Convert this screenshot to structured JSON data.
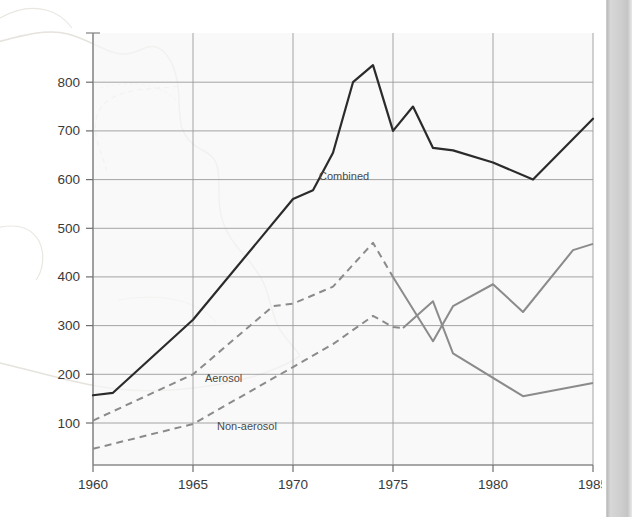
{
  "chart_data": {
    "type": "line",
    "title": "",
    "xlabel": "",
    "ylabel": "",
    "xlim": [
      1960,
      1985
    ],
    "ylim": [
      0,
      860
    ],
    "grid": true,
    "legend_position": "inline-annotations",
    "x_ticks": [
      "1960",
      "1965",
      "1970",
      "1975",
      "1980",
      "1985"
    ],
    "x_tick_values": [
      1960,
      1965,
      1970,
      1975,
      1980,
      1985
    ],
    "y_ticks": [
      "100",
      "200",
      "300",
      "400",
      "500",
      "600",
      "700",
      "800"
    ],
    "y_tick_values": [
      100,
      200,
      300,
      400,
      500,
      600,
      700,
      800
    ],
    "series": [
      {
        "name": "Combined",
        "label": "Combined",
        "color": "#2b2b2b",
        "style": "solid",
        "width": 2.2,
        "x": [
          1960,
          1961,
          1965,
          1970,
          1971,
          1972,
          1973,
          1974,
          1975,
          1976,
          1977,
          1978,
          1980,
          1982,
          1985
        ],
        "values": [
          157,
          162,
          312,
          560,
          578,
          655,
          800,
          835,
          700,
          750,
          665,
          660,
          635,
          600,
          725
        ]
      },
      {
        "name": "Aerosol",
        "label": "Aerosol",
        "color": "#8b8b8b",
        "style": "dashed-then-solid",
        "dashed_until": 1975,
        "width": 2.0,
        "x": [
          1960,
          1965,
          1969,
          1970,
          1972,
          1974,
          1975,
          1977,
          1978,
          1980,
          1981.5,
          1984,
          1985
        ],
        "values": [
          105,
          200,
          340,
          345,
          380,
          470,
          400,
          268,
          340,
          385,
          328,
          455,
          468
        ]
      },
      {
        "name": "Non-aerosol",
        "label": "Non-aerosol",
        "color": "#8b8b8b",
        "style": "dashed-then-solid",
        "dashed_until": 1975.5,
        "width": 2.0,
        "x": [
          1960,
          1965,
          1970,
          1972,
          1974,
          1975,
          1975.5,
          1977,
          1978,
          1981.5,
          1985
        ],
        "values": [
          47,
          98,
          215,
          262,
          320,
          297,
          295,
          350,
          243,
          155,
          182
        ]
      }
    ],
    "annotations": [
      {
        "text": "Combined",
        "x": 1971.3,
        "y": 600,
        "name": "combined"
      },
      {
        "text": "Aerosol",
        "x": 1965.6,
        "y": 185,
        "name": "aerosol"
      },
      {
        "text": "Non-aerosol",
        "x": 1966.2,
        "y": 85,
        "name": "non-aerosol"
      }
    ],
    "colors": {
      "plot_background": "#f7f7f7",
      "gridline": "#9a9a9a",
      "axis": "#8a8a8a",
      "combined_line": "#2b2b2b",
      "aerosol_line": "#8b8b8b",
      "nonaerosol_line": "#8b8b8b",
      "watermark": "#eceae6",
      "text": "#3a3a3a",
      "page_edge": "#cfcfcf"
    }
  },
  "background": {
    "watermark_name": "map-outline-watermark"
  }
}
